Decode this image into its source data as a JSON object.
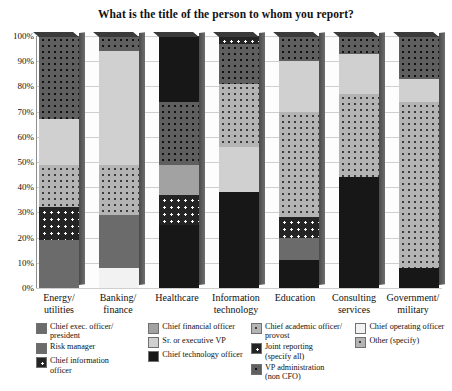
{
  "chart_data": {
    "type": "bar",
    "title": "What is the title of the person to whom you report?",
    "xlabel": "",
    "ylabel": "",
    "ylim": [
      0,
      100
    ],
    "grid": true,
    "stacked": true,
    "stack_total": 100,
    "legend_position": "bottom",
    "ytick_labels": [
      "100%",
      "90%",
      "80%",
      "70%",
      "60%",
      "50%",
      "40%",
      "30%",
      "20%",
      "10%",
      "0%"
    ],
    "ytick_values": [
      100,
      90,
      80,
      70,
      60,
      50,
      40,
      30,
      20,
      10,
      0
    ],
    "categories": [
      "Energy/\nutilities",
      "Banking/\nfinance",
      "Healthcare",
      "Information\ntechnology",
      "Education",
      "Consulting\nservices",
      "Government/\nmilitary"
    ],
    "series": [
      {
        "name": "Chief exec. officer/president",
        "key": "ceo",
        "pattern": "dark-gray-solid",
        "color": "#6b6b6b",
        "values": [
          19,
          21,
          0,
          0,
          9,
          0,
          0
        ]
      },
      {
        "name": "Chief financial officer",
        "key": "cfo",
        "pattern": "medium-gray-solid",
        "color": "#a2a2a2",
        "values": [
          0,
          0,
          12,
          0,
          0,
          0,
          0
        ]
      },
      {
        "name": "Chief academic officer/provost",
        "key": "cao",
        "pattern": "light-dotted",
        "color": "#b4b4b4",
        "values": [
          17,
          20,
          0,
          25,
          42,
          33,
          66
        ]
      },
      {
        "name": "Chief operating officer",
        "key": "coo",
        "pattern": "white-solid",
        "color": "#f2f2f2",
        "values": [
          0,
          8,
          0,
          0,
          0,
          0,
          0
        ]
      },
      {
        "name": "Risk manager",
        "key": "risk",
        "pattern": "dark-gray-solid",
        "color": "#6b6b6b",
        "values": [
          0,
          0,
          0,
          0,
          0,
          0,
          0
        ]
      },
      {
        "name": "Sr. or executive VP",
        "key": "svp",
        "pattern": "light-gray-solid",
        "color": "#d0d0d0",
        "values": [
          18,
          45,
          0,
          18,
          20,
          16,
          9
        ]
      },
      {
        "name": "Joint reporting (specify all)",
        "key": "joint",
        "pattern": "white-dotted",
        "color": "#242424",
        "values": [
          13,
          0,
          12,
          3,
          8,
          0,
          0
        ]
      },
      {
        "name": "Chief information officer",
        "key": "cio",
        "pattern": "white-dotted",
        "color": "#242424",
        "values": [
          0,
          0,
          0,
          0,
          0,
          0,
          0
        ]
      },
      {
        "name": "VP administration (non CFO)",
        "key": "vpadmin",
        "pattern": "dark-dotted",
        "color": "#5f5f5f",
        "values": [
          0,
          0,
          0,
          0,
          0,
          0,
          0
        ]
      },
      {
        "name": "Chief technology officer",
        "key": "cto",
        "pattern": "black-solid",
        "color": "#171717",
        "values": [
          0,
          0,
          51,
          38,
          11,
          44,
          8
        ]
      },
      {
        "name": "Other (specify)",
        "key": "other",
        "pattern": "dark-dotted",
        "color": "#5f5f5f",
        "values": [
          33,
          6,
          25,
          16,
          10,
          7,
          17
        ]
      }
    ],
    "stacks": [
      {
        "category": "Energy/ utilities",
        "segments": [
          {
            "label": "Chief exec. officer/president",
            "from": 0,
            "to": 19,
            "pattern": "dark-gray-solid"
          },
          {
            "label": "Joint reporting (specify all)",
            "from": 19,
            "to": 32,
            "pattern": "white-dotted"
          },
          {
            "label": "Chief academic officer/provost",
            "from": 32,
            "to": 49,
            "pattern": "light-dotted"
          },
          {
            "label": "Sr. or executive VP",
            "from": 49,
            "to": 67,
            "pattern": "light-gray-solid"
          },
          {
            "label": "Other (specify)",
            "from": 67,
            "to": 100,
            "pattern": "dark-dotted"
          }
        ]
      },
      {
        "category": "Banking/ finance",
        "segments": [
          {
            "label": "Chief operating officer",
            "from": 0,
            "to": 8,
            "pattern": "white-solid"
          },
          {
            "label": "Chief exec. officer/president",
            "from": 8,
            "to": 29,
            "pattern": "dark-gray-solid"
          },
          {
            "label": "Chief academic officer/provost",
            "from": 29,
            "to": 49,
            "pattern": "light-dotted"
          },
          {
            "label": "Sr. or executive VP",
            "from": 49,
            "to": 94,
            "pattern": "light-gray-solid"
          },
          {
            "label": "Other (specify)",
            "from": 94,
            "to": 100,
            "pattern": "dark-dotted"
          }
        ]
      },
      {
        "category": "Healthcare",
        "segments": [
          {
            "label": "Chief technology officer",
            "from": 0,
            "to": 25,
            "pattern": "black-solid"
          },
          {
            "label": "Joint reporting (specify all)",
            "from": 25,
            "to": 37,
            "pattern": "white-dotted"
          },
          {
            "label": "Chief financial officer",
            "from": 37,
            "to": 49,
            "pattern": "medium-gray-solid"
          },
          {
            "label": "Other (specify)",
            "from": 49,
            "to": 74,
            "pattern": "dark-dotted"
          },
          {
            "label": "Chief technology officer",
            "from": 74,
            "to": 100,
            "pattern": "black-solid"
          }
        ]
      },
      {
        "category": "Information technology",
        "segments": [
          {
            "label": "Chief technology officer",
            "from": 0,
            "to": 38,
            "pattern": "black-solid"
          },
          {
            "label": "Sr. or executive VP",
            "from": 38,
            "to": 56,
            "pattern": "light-gray-solid"
          },
          {
            "label": "Chief academic officer/provost",
            "from": 56,
            "to": 81,
            "pattern": "light-dotted"
          },
          {
            "label": "Other (specify)",
            "from": 81,
            "to": 97,
            "pattern": "dark-dotted"
          },
          {
            "label": "Joint reporting (specify all)",
            "from": 97,
            "to": 100,
            "pattern": "white-dotted"
          }
        ]
      },
      {
        "category": "Education",
        "segments": [
          {
            "label": "Chief technology officer",
            "from": 0,
            "to": 11,
            "pattern": "black-solid"
          },
          {
            "label": "Chief exec. officer/president",
            "from": 11,
            "to": 20,
            "pattern": "dark-gray-solid"
          },
          {
            "label": "Joint reporting (specify all)",
            "from": 20,
            "to": 28,
            "pattern": "white-dotted"
          },
          {
            "label": "Chief academic officer/provost",
            "from": 28,
            "to": 70,
            "pattern": "light-dotted"
          },
          {
            "label": "Sr. or executive VP",
            "from": 70,
            "to": 90,
            "pattern": "light-gray-solid"
          },
          {
            "label": "Other (specify)",
            "from": 90,
            "to": 100,
            "pattern": "dark-dotted"
          }
        ]
      },
      {
        "category": "Consulting services",
        "segments": [
          {
            "label": "Chief technology officer",
            "from": 0,
            "to": 44,
            "pattern": "black-solid"
          },
          {
            "label": "Chief academic officer/provost",
            "from": 44,
            "to": 77,
            "pattern": "light-dotted"
          },
          {
            "label": "Sr. or executive VP",
            "from": 77,
            "to": 93,
            "pattern": "light-gray-solid"
          },
          {
            "label": "Other (specify)",
            "from": 93,
            "to": 100,
            "pattern": "dark-dotted"
          }
        ]
      },
      {
        "category": "Government/ military",
        "segments": [
          {
            "label": "Chief technology officer",
            "from": 0,
            "to": 8,
            "pattern": "black-solid"
          },
          {
            "label": "Chief academic officer/provost",
            "from": 8,
            "to": 74,
            "pattern": "light-dotted"
          },
          {
            "label": "Sr. or executive VP",
            "from": 74,
            "to": 83,
            "pattern": "light-gray-solid"
          },
          {
            "label": "Other (specify)",
            "from": 83,
            "to": 100,
            "pattern": "dark-dotted"
          }
        ]
      }
    ]
  },
  "legend": {
    "columns": [
      {
        "items": [
          {
            "label": "Chief exec. officer/\nprovost_placeholder",
            "text": "Chief exec. officer/ president",
            "line1": "Chief exec. officer/",
            "line2": "president",
            "pattern": "dark-gray-solid"
          },
          {
            "text": "Risk manager",
            "line1": "Risk manager",
            "line2": "",
            "pattern": "dark-gray-solid"
          },
          {
            "text": "Chief information officer",
            "line1": "Chief information",
            "line2": "officer",
            "pattern": "white-dotted"
          }
        ]
      },
      {
        "items": [
          {
            "text": "Chief financial officer",
            "line1": "Chief financial officer",
            "line2": "",
            "pattern": "medium-gray-solid"
          },
          {
            "text": "Sr. or executive VP",
            "line1": "Sr. or executive VP",
            "line2": "",
            "pattern": "light-gray-solid"
          },
          {
            "text": "Chief technology officer",
            "line1": "Chief technology officer",
            "line2": "",
            "pattern": "black-solid"
          }
        ]
      },
      {
        "items": [
          {
            "text": "Chief academic officer/ provost",
            "line1": "Chief academic officer/",
            "line2": "provost",
            "pattern": "light-dotted"
          },
          {
            "text": "Joint reporting (specify all)",
            "line1": "Joint reporting",
            "line2": "(specify all)",
            "pattern": "white-dotted"
          },
          {
            "text": "VP administration (non CFO)",
            "line1": "VP administration",
            "line2": "(non CFO)",
            "pattern": "dark-dotted"
          }
        ]
      },
      {
        "items": [
          {
            "text": "Chief operating officer",
            "line1": "Chief operating officer",
            "line2": "",
            "pattern": "white-solid"
          },
          {
            "text": "Other (specify)",
            "line1": "Other (specify)",
            "line2": "",
            "pattern": "light-dotted"
          }
        ]
      }
    ]
  }
}
